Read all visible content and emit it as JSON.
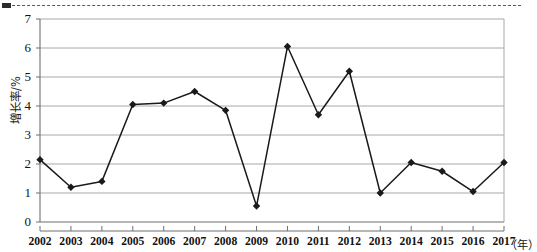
{
  "figure": {
    "name": "line-chart-growth-rate",
    "top_rule": "dashed-cut-line",
    "background_color": "#ffffff",
    "line_color": "#1a1a1a",
    "grid_color": "#a8a8a8",
    "axis_color": "#6e6e6e"
  },
  "chart_data": {
    "type": "line",
    "title": "",
    "xlabel": "（年）",
    "ylabel": "增长率/%",
    "ylim": [
      0,
      7
    ],
    "yticks": [
      0,
      1,
      2,
      3,
      4,
      5,
      6,
      7
    ],
    "ytick_labels": [
      "0",
      "1",
      "2",
      "3",
      "4",
      "5",
      "6",
      "7"
    ],
    "grid": true,
    "grid_axis": "y",
    "legend": "none",
    "marker": "diamond",
    "categories": [
      "2002",
      "2003",
      "2004",
      "2005",
      "2006",
      "2007",
      "2008",
      "2009",
      "2010",
      "2011",
      "2012",
      "2013",
      "2014",
      "2015",
      "2016",
      "2017"
    ],
    "values": [
      2.15,
      1.2,
      1.4,
      4.05,
      4.1,
      4.5,
      3.85,
      0.55,
      6.05,
      3.7,
      5.2,
      1.0,
      2.05,
      1.75,
      1.05,
      2.05
    ],
    "series": [
      {
        "name": "增长率/%",
        "values": [
          2.15,
          1.2,
          1.4,
          4.05,
          4.1,
          4.5,
          3.85,
          0.55,
          6.05,
          3.7,
          5.2,
          1.0,
          2.05,
          1.75,
          1.05,
          2.05
        ]
      }
    ]
  }
}
